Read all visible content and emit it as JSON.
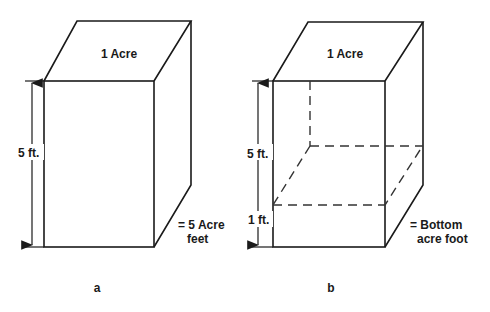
{
  "figures": [
    {
      "id": "a",
      "caption": "a",
      "top_label": "1 Acre",
      "height_label": "5 ft.",
      "result_label_line1": "= 5 Acre",
      "result_label_line2": "feet"
    },
    {
      "id": "b",
      "caption": "b",
      "top_label": "1 Acre",
      "height_label_upper": "5 ft.",
      "height_label_lower": "1 ft.",
      "result_label_line1": "= Bottom",
      "result_label_line2": "acre foot"
    }
  ]
}
